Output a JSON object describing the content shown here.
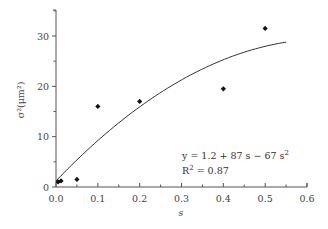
{
  "chart_data": {
    "type": "scatter",
    "title": "",
    "xlabel": "s",
    "ylabel": "σ²(μm²)",
    "xlim": [
      0,
      0.6
    ],
    "ylim": [
      0,
      35
    ],
    "x_ticks": [
      "0.0",
      "0.1",
      "0.2",
      "0.3",
      "0.4",
      "0.5",
      "0.6"
    ],
    "y_ticks": [
      "0",
      "10",
      "20",
      "30"
    ],
    "grid": false,
    "series": [
      {
        "name": "measured",
        "marker": "diamond",
        "x": [
          0.005,
          0.012,
          0.05,
          0.1,
          0.2,
          0.4,
          0.5
        ],
        "y": [
          1.0,
          1.2,
          1.5,
          16.0,
          17.0,
          19.5,
          31.5
        ]
      },
      {
        "name": "fit",
        "line": true,
        "equation": {
          "a": 1.2,
          "b": 87,
          "c": -67
        },
        "x_range": [
          0,
          0.55
        ]
      }
    ],
    "annotations": {
      "equation": "y = 1.2 + 87 s − 67 s",
      "equation_sup": "2",
      "r2_label": "R",
      "r2_sup": "2",
      "r2_value": " = 0.87"
    }
  }
}
